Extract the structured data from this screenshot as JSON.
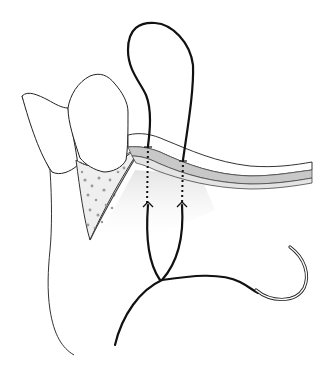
{
  "figure": {
    "colors": {
      "background": "#ffffff",
      "outline": "#222222",
      "suture": "#111111",
      "gingiva_band": "#c8c8c8",
      "gingiva_inner": "#e2e2e2",
      "bone_fill": "#eeeeee",
      "bone_dots": "#9a9a9a",
      "shadow": "#e8e8e8"
    },
    "elements": [
      {
        "name": "rear-tooth",
        "label": "tooth"
      },
      {
        "name": "front-tooth",
        "label": "tooth"
      },
      {
        "name": "alveolar-bone",
        "label": "bone"
      },
      {
        "name": "mucosal-flap",
        "label": "flap"
      },
      {
        "name": "lip-outline",
        "label": "lip"
      },
      {
        "name": "suture-loop",
        "label": "suture"
      },
      {
        "name": "suture-needle",
        "label": "needle"
      }
    ]
  }
}
